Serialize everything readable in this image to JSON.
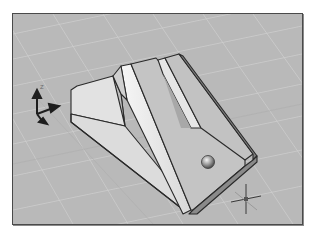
{
  "viewport": {
    "name": "3D model viewport",
    "background_color": "#b9b9b9",
    "grid_color": "#d4d4d4",
    "frame_color": "#4a4a4a",
    "visual_style": "shaded with edges"
  },
  "ucs_icon": {
    "z_label": "Z",
    "axes": [
      "Z",
      "X",
      "Y"
    ]
  },
  "model": {
    "description": "wedge-shaped bracket with slot and hole",
    "face_light": "#e4e4e4",
    "face_mid": "#c6c6c6",
    "face_dark": "#a6a6a6",
    "edge_color": "#2a2a2a"
  },
  "cursor": {
    "type": "crosshair"
  }
}
